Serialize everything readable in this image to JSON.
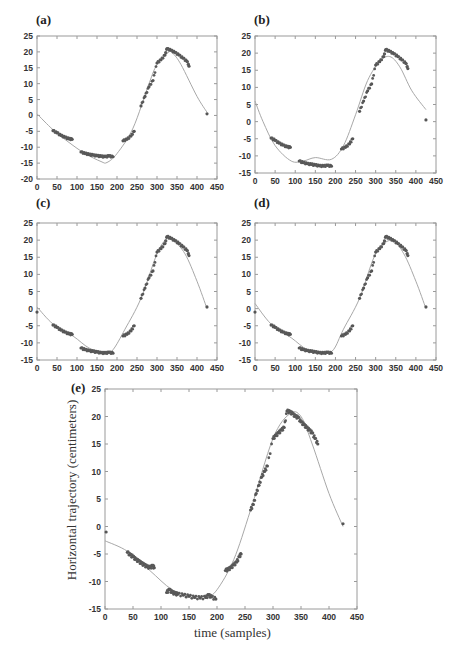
{
  "figure": {
    "panels": [
      {
        "id": "a",
        "label": "(a)"
      },
      {
        "id": "b",
        "label": "(b)"
      },
      {
        "id": "c",
        "label": "(c)"
      },
      {
        "id": "d",
        "label": "(d)"
      },
      {
        "id": "e",
        "label": "(e)",
        "xlabel": "time (samples)",
        "ylabel": "Horizontal trajectory (centimeters)"
      }
    ]
  },
  "chart_data": [
    {
      "panel": "(a)",
      "type": "scatter+line",
      "xlim": [
        0,
        450
      ],
      "ylim": [
        -20,
        25
      ],
      "xticks": [
        0,
        50,
        100,
        150,
        200,
        250,
        300,
        350,
        400,
        450
      ],
      "yticks": [
        -20,
        -15,
        -10,
        -5,
        0,
        5,
        10,
        15,
        20,
        25
      ],
      "series": [
        {
          "name": "measured samples",
          "type": "scatter",
          "x": [
            40,
            50,
            60,
            70,
            80,
            88,
            110,
            120,
            130,
            140,
            150,
            160,
            170,
            180,
            190,
            215,
            225,
            235,
            243,
            260,
            270,
            280,
            290,
            300,
            310,
            320,
            325,
            335,
            345,
            355,
            365,
            375,
            380,
            425
          ],
          "y": [
            -4.8,
            -5.5,
            -6.3,
            -6.9,
            -7.4,
            -7.5,
            -11.5,
            -12,
            -12.3,
            -12.5,
            -12.7,
            -12.9,
            -13,
            -12.8,
            -13,
            -8,
            -7.5,
            -6.5,
            -5,
            3,
            6,
            9,
            11,
            16.5,
            17.5,
            19,
            21,
            20.5,
            19.8,
            19,
            18,
            17,
            15.5,
            0.5
          ]
        },
        {
          "name": "fitted curve",
          "type": "line",
          "x": [
            0,
            40,
            80,
            120,
            160,
            175,
            200,
            240,
            280,
            300,
            330,
            340,
            360,
            400,
            425
          ],
          "y": [
            0.5,
            -4.5,
            -8.5,
            -12,
            -14.5,
            -14.8,
            -12,
            -4,
            10,
            16,
            20,
            19.5,
            16,
            6,
            1
          ]
        }
      ]
    },
    {
      "panel": "(b)",
      "type": "scatter+line",
      "xlim": [
        0,
        450
      ],
      "ylim": [
        -15,
        25
      ],
      "xticks": [
        0,
        50,
        100,
        150,
        200,
        250,
        300,
        350,
        400,
        450
      ],
      "yticks": [
        -15,
        -10,
        -5,
        0,
        5,
        10,
        15,
        20,
        25
      ],
      "series": [
        {
          "name": "measured samples",
          "type": "scatter",
          "x": [
            40,
            50,
            60,
            70,
            80,
            88,
            110,
            120,
            130,
            140,
            150,
            160,
            170,
            180,
            190,
            215,
            225,
            235,
            243,
            260,
            270,
            280,
            290,
            300,
            310,
            320,
            325,
            335,
            345,
            355,
            365,
            375,
            380,
            425
          ],
          "y": [
            -4.8,
            -5.5,
            -6.3,
            -6.9,
            -7.4,
            -7.5,
            -11.5,
            -12,
            -12.3,
            -12.5,
            -12.7,
            -12.9,
            -13,
            -12.8,
            -13,
            -8,
            -7.5,
            -6.5,
            -5,
            3,
            6,
            9,
            11,
            16.5,
            17.5,
            19,
            21,
            20.5,
            19.8,
            19,
            18,
            17,
            15.5,
            0.5
          ]
        },
        {
          "name": "fitted curve",
          "type": "line",
          "x": [
            0,
            20,
            50,
            90,
            120,
            150,
            190,
            220,
            250,
            280,
            310,
            335,
            360,
            390,
            425
          ],
          "y": [
            6,
            0,
            -7,
            -11.5,
            -11.5,
            -10.5,
            -11,
            -7,
            2,
            12,
            17.5,
            19,
            16,
            9,
            3.5
          ]
        }
      ]
    },
    {
      "panel": "(c)",
      "type": "scatter+line",
      "xlim": [
        0,
        450
      ],
      "ylim": [
        -15,
        25
      ],
      "xticks": [
        0,
        50,
        100,
        150,
        200,
        250,
        300,
        350,
        400,
        450
      ],
      "yticks": [
        -15,
        -10,
        -5,
        0,
        5,
        10,
        15,
        20,
        25
      ],
      "series": [
        {
          "name": "measured samples",
          "type": "scatter",
          "x": [
            0,
            40,
            50,
            60,
            70,
            80,
            88,
            110,
            120,
            130,
            140,
            150,
            160,
            170,
            180,
            190,
            215,
            225,
            235,
            243,
            260,
            270,
            280,
            290,
            300,
            310,
            320,
            325,
            335,
            345,
            355,
            365,
            375,
            380,
            425
          ],
          "y": [
            -1,
            -4.8,
            -5.5,
            -6.3,
            -6.9,
            -7.4,
            -7.5,
            -11.5,
            -12,
            -12.3,
            -12.5,
            -12.7,
            -12.9,
            -13,
            -12.8,
            -13,
            -8,
            -7.5,
            -6.5,
            -5,
            3,
            6,
            9,
            11,
            16.5,
            17.5,
            19,
            21,
            20.5,
            19.8,
            19,
            18,
            17,
            15.5,
            0.5
          ]
        },
        {
          "name": "fitted curve",
          "type": "line",
          "x": [
            0,
            40,
            90,
            130,
            170,
            190,
            220,
            260,
            300,
            325,
            340,
            370,
            400,
            425
          ],
          "y": [
            0.5,
            -4.5,
            -8,
            -11.5,
            -13,
            -12,
            -6,
            3,
            16,
            20.5,
            20,
            16,
            8,
            0
          ]
        }
      ]
    },
    {
      "panel": "(d)",
      "type": "scatter+line",
      "xlim": [
        0,
        450
      ],
      "ylim": [
        -15,
        25
      ],
      "xticks": [
        0,
        50,
        100,
        150,
        200,
        250,
        300,
        350,
        400,
        450
      ],
      "yticks": [
        -15,
        -10,
        -5,
        0,
        5,
        10,
        15,
        20,
        25
      ],
      "series": [
        {
          "name": "measured samples",
          "type": "scatter",
          "x": [
            0,
            40,
            50,
            60,
            70,
            80,
            88,
            110,
            120,
            130,
            140,
            150,
            160,
            170,
            180,
            190,
            215,
            225,
            235,
            243,
            260,
            270,
            280,
            290,
            300,
            310,
            320,
            325,
            335,
            345,
            355,
            365,
            375,
            380,
            425
          ],
          "y": [
            -1,
            -4.8,
            -5.5,
            -6.3,
            -6.9,
            -7.4,
            -7.5,
            -11.5,
            -12,
            -12.3,
            -12.5,
            -12.7,
            -12.9,
            -13,
            -12.8,
            -13,
            -8,
            -7.5,
            -6.5,
            -5,
            3,
            6,
            9,
            11,
            16.5,
            17.5,
            19,
            21,
            20.5,
            19.8,
            19,
            18,
            17,
            15.5,
            0.5
          ]
        },
        {
          "name": "fitted curve",
          "type": "line",
          "x": [
            0,
            40,
            90,
            130,
            170,
            195,
            220,
            260,
            300,
            340,
            370,
            400,
            425
          ],
          "y": [
            1.5,
            -4.5,
            -8.5,
            -12,
            -13,
            -12,
            -6,
            3,
            16,
            20,
            16,
            8,
            0
          ]
        }
      ]
    },
    {
      "panel": "(e)",
      "type": "scatter+line",
      "xlabel": "time (samples)",
      "ylabel": "Horizontal trajectory (centimeters)",
      "xlim": [
        0,
        450
      ],
      "ylim": [
        -15,
        25
      ],
      "xticks": [
        0,
        50,
        100,
        150,
        200,
        250,
        300,
        350,
        400,
        450
      ],
      "yticks": [
        -15,
        -10,
        -5,
        0,
        5,
        10,
        15,
        20,
        25
      ],
      "series": [
        {
          "name": "measured samples",
          "type": "scatter",
          "x": [
            2,
            40,
            45,
            50,
            55,
            60,
            65,
            70,
            75,
            80,
            85,
            88,
            110,
            115,
            120,
            125,
            130,
            140,
            150,
            160,
            170,
            180,
            185,
            190,
            198,
            215,
            220,
            225,
            230,
            235,
            240,
            243,
            260,
            265,
            270,
            275,
            280,
            285,
            290,
            300,
            305,
            310,
            315,
            320,
            325,
            330,
            335,
            340,
            345,
            350,
            355,
            360,
            365,
            370,
            375,
            380,
            425
          ],
          "y": [
            -1,
            -4.7,
            -5.2,
            -5.5,
            -6,
            -6.3,
            -6.7,
            -7,
            -7.3,
            -7.5,
            -7.2,
            -7.5,
            -12,
            -11.5,
            -12,
            -12.2,
            -12.3,
            -12.5,
            -12.7,
            -12.9,
            -13,
            -12.9,
            -12.5,
            -12.8,
            -13.2,
            -8,
            -7.8,
            -7.5,
            -7,
            -6.5,
            -5.5,
            -5,
            3,
            4,
            6,
            7.5,
            9,
            10,
            11,
            16,
            16.5,
            17,
            17.5,
            18,
            21,
            20.8,
            20.5,
            20,
            19.8,
            19,
            18.5,
            18,
            17.5,
            17,
            16,
            15,
            0.5
          ]
        },
        {
          "name": "fitted curve",
          "type": "line",
          "x": [
            0,
            40,
            80,
            120,
            160,
            180,
            200,
            230,
            260,
            300,
            330,
            350,
            370,
            400,
            425
          ],
          "y": [
            -2.6,
            -4.5,
            -8,
            -11.5,
            -13,
            -13,
            -11.5,
            -6,
            3,
            16,
            20.5,
            20,
            15,
            6,
            0
          ]
        }
      ]
    }
  ]
}
